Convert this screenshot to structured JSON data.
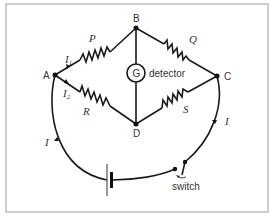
{
  "diagram": {
    "nodes": {
      "A": "A",
      "B": "B",
      "C": "C",
      "D": "D"
    },
    "resistors": {
      "P": "P",
      "Q": "Q",
      "R": "R",
      "S": "S"
    },
    "galvanometer": {
      "symbol": "G",
      "label": "detector"
    },
    "currents": {
      "I1_base": "I",
      "I1_sub": "1",
      "I2_base": "I",
      "I2_sub": "2",
      "I_left": "I",
      "I_right": "I"
    },
    "switch_label": "switch",
    "colors": {
      "wire": "#1a1a1a",
      "frame": "#9a9a9a",
      "text": "#333333"
    }
  }
}
